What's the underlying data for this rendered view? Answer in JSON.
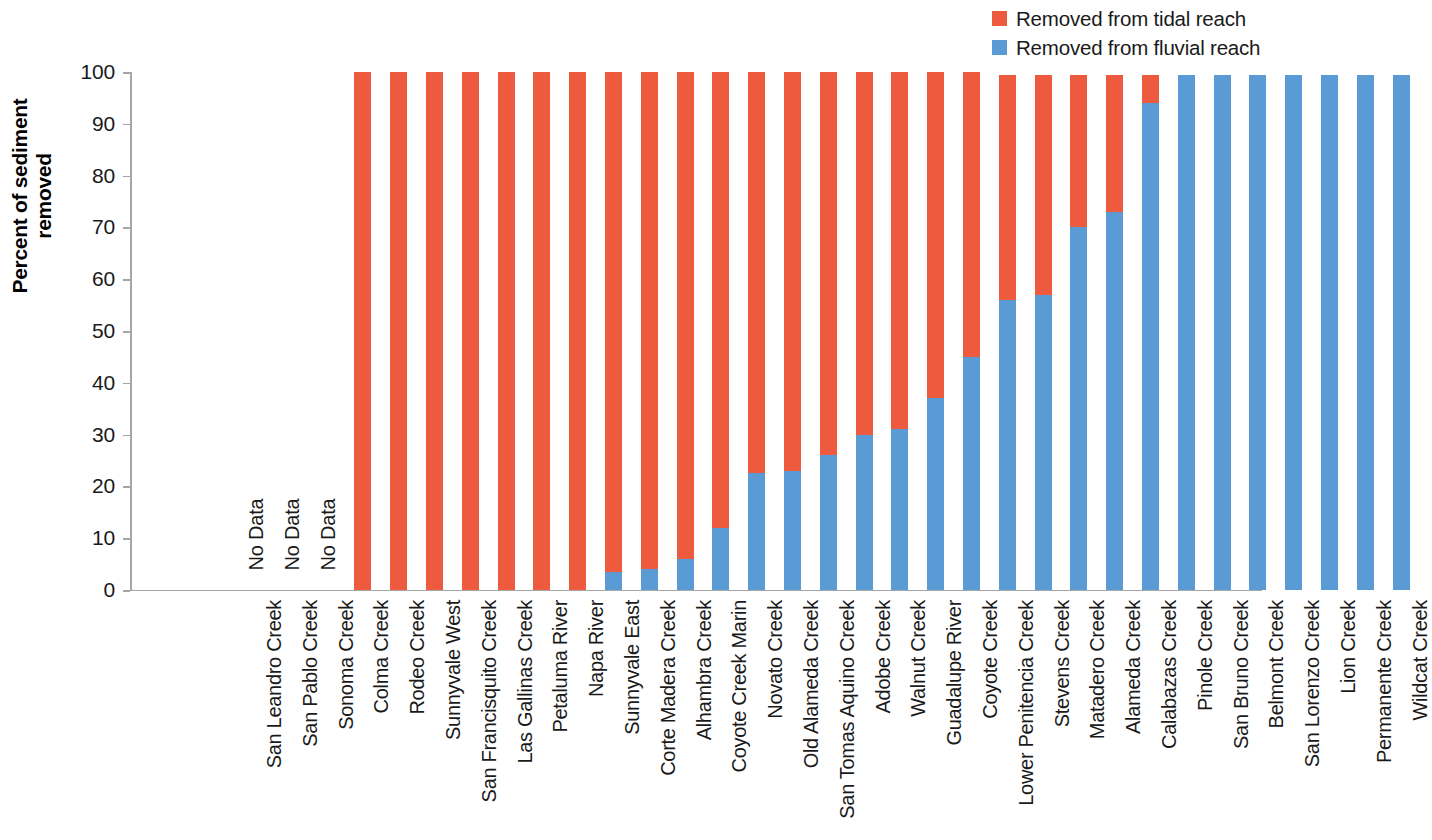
{
  "legend": {
    "position": "top-right",
    "items": [
      {
        "label": "Removed from tidal reach",
        "color": "#ED5A3D",
        "key": "tidal"
      },
      {
        "label": "Removed from fluvial reach",
        "color": "#5B9BD5",
        "key": "fluvial"
      }
    ]
  },
  "axes": {
    "y_title": "Percent of sediment removed",
    "y_ticks": [
      "100",
      "90",
      "80",
      "70",
      "60",
      "50",
      "40",
      "30",
      "20",
      "10",
      "0"
    ],
    "y_min": 0,
    "y_max": 100
  },
  "annotations": {
    "no_data_text": "No Data"
  },
  "chart_data": {
    "type": "bar",
    "title": "",
    "xlabel": "",
    "ylabel": "Percent of sediment removed",
    "ylim": [
      0,
      100
    ],
    "grid": false,
    "stacked": true,
    "legend_position": "top-right",
    "categories": [
      "San Leandro Creek",
      "San Pablo Creek",
      "Sonoma Creek",
      "Colma Creek",
      "Rodeo Creek",
      "Sunnyvale West",
      "San Francisquito Creek",
      "Las Gallinas Creek",
      "Petaluma River",
      "Napa River",
      "Sunnyvale East",
      "Corte Madera Creek",
      "Alhambra Creek",
      "Coyote Creek Marin",
      "Novato Creek",
      "Old Alameda Creek",
      "San Tomas Aquino Creek",
      "Adobe Creek",
      "Walnut Creek",
      "Guadalupe River",
      "Coyote Creek",
      "Lower Penitencia Creek",
      "Stevens Creek",
      "Matadero Creek",
      "Alameda Creek",
      "Calabazas Creek",
      "Pinole Creek",
      "San Bruno Creek",
      "Belmont Creek",
      "San Lorenzo Creek",
      "Lion Creek",
      "Permanente Creek",
      "Wildcat Creek"
    ],
    "series": [
      {
        "name": "Removed from fluvial reach",
        "color": "#5B9BD5",
        "values": [
          null,
          null,
          null,
          0,
          0,
          0,
          0,
          0,
          0,
          0,
          3.5,
          4,
          6,
          12,
          22.5,
          23,
          26,
          30,
          31,
          37,
          45,
          56,
          57,
          70,
          73,
          94,
          99.5,
          99.5,
          99.5,
          99.5,
          99.5,
          99.5,
          99.5
        ]
      },
      {
        "name": "Removed from tidal reach",
        "color": "#ED5A3D",
        "values": [
          null,
          null,
          null,
          100,
          100,
          100,
          100,
          100,
          100,
          100,
          96.5,
          96,
          94,
          88,
          77.5,
          77,
          74,
          70,
          69,
          63,
          55,
          43.5,
          42.5,
          29.5,
          26.5,
          5.5,
          0,
          0,
          0,
          0,
          0,
          0,
          0
        ]
      }
    ],
    "no_data_categories": [
      "San Leandro Creek",
      "San Pablo Creek",
      "Sonoma Creek"
    ]
  }
}
